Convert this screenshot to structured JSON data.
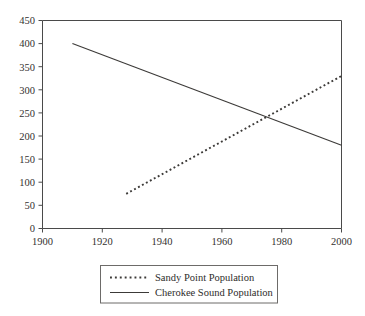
{
  "chart_data": {
    "type": "line",
    "title": "",
    "subtitle": "",
    "xlabel": "",
    "ylabel": "",
    "xlim": [
      1900,
      2000
    ],
    "ylim": [
      0,
      450
    ],
    "grid": false,
    "legend_position": "bottom",
    "x_ticks": [
      "1900",
      "1920",
      "1940",
      "1960",
      "1980",
      "2000"
    ],
    "x_tick_values": [
      1900,
      1920,
      1940,
      1960,
      1980,
      2000
    ],
    "y_ticks": [
      "0",
      "50",
      "100",
      "150",
      "200",
      "250",
      "300",
      "350",
      "400",
      "450"
    ],
    "y_tick_values": [
      0,
      50,
      100,
      150,
      200,
      250,
      300,
      350,
      400,
      450
    ],
    "series": [
      {
        "name": "Sandy Point Population",
        "style": "dotted",
        "color": "#3c3a38",
        "x": [
          1928,
          2000
        ],
        "values": [
          75,
          330
        ]
      },
      {
        "name": "Cherokee Sound Population",
        "style": "solid",
        "color": "#3c3a38",
        "x": [
          1910,
          2000
        ],
        "values": [
          400,
          180
        ]
      }
    ]
  },
  "legend": {
    "entries": [
      {
        "label": "Sandy Point Population",
        "style": "dotted"
      },
      {
        "label": "Cherokee Sound Population",
        "style": "solid"
      }
    ]
  },
  "colors": {
    "background": "#ffffff",
    "axis": "#4a4a4a",
    "series": "#3c3a38",
    "legend_border": "#6d6b69",
    "text": "#2e2c2a"
  }
}
